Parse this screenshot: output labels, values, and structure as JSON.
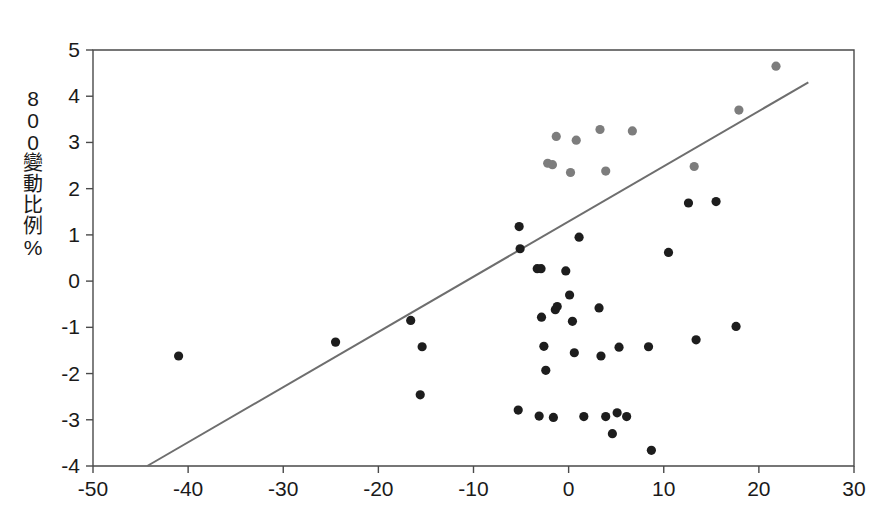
{
  "chart_data": {
    "type": "scatter",
    "title": "",
    "subtitle": "",
    "xlabel": "",
    "ylabel": "800變動比例%",
    "ylabel_chars": [
      "8",
      "0",
      "0",
      "變",
      "動",
      "比",
      "例",
      "%"
    ],
    "xlim": [
      -50,
      30
    ],
    "ylim": [
      -4,
      5
    ],
    "xticks": [
      -50,
      -40,
      -30,
      -20,
      -10,
      0,
      10,
      20,
      30
    ],
    "yticks": [
      -4,
      -3,
      -2,
      -1,
      0,
      1,
      2,
      3,
      4,
      5
    ],
    "xtick_labels": [
      "-50",
      "-40",
      "-30",
      "-20",
      "-10",
      "0",
      "10",
      "20",
      "30"
    ],
    "ytick_labels": [
      "-4",
      "-3",
      "-2",
      "-1",
      "0",
      "1",
      "2",
      "3",
      "4",
      "5"
    ],
    "grid": false,
    "legend": null,
    "legend_position": "none",
    "marker_colors": {
      "dark": "#1d1d1d",
      "light": "#7d7d7d"
    },
    "trendline": {
      "color": "#6e6e6e",
      "x_start": -44.3,
      "y_start": -4.0,
      "x_end": 25.2,
      "y_end": 4.3,
      "slope": 0.1193,
      "intercept": 1.286
    },
    "series": [
      {
        "name": "dark-points",
        "color": "#1d1d1d",
        "points": [
          [
            -41.0,
            -1.62
          ],
          [
            -24.5,
            -1.32
          ],
          [
            -16.6,
            -0.85
          ],
          [
            -15.4,
            -1.42
          ],
          [
            -15.6,
            -2.46
          ],
          [
            -5.2,
            1.18
          ],
          [
            -5.1,
            0.7
          ],
          [
            -5.3,
            -2.79
          ],
          [
            -3.3,
            0.27
          ],
          [
            -2.9,
            0.27
          ],
          [
            -2.85,
            -0.78
          ],
          [
            -2.6,
            -1.41
          ],
          [
            -2.4,
            -1.93
          ],
          [
            -3.1,
            -2.92
          ],
          [
            -1.4,
            -0.62
          ],
          [
            -1.2,
            -0.55
          ],
          [
            -1.6,
            -2.95
          ],
          [
            -0.3,
            0.22
          ],
          [
            0.1,
            -0.3
          ],
          [
            0.4,
            -0.87
          ],
          [
            0.6,
            -1.55
          ],
          [
            1.1,
            0.95
          ],
          [
            1.6,
            -2.93
          ],
          [
            3.2,
            -0.58
          ],
          [
            3.4,
            -1.62
          ],
          [
            3.9,
            -2.93
          ],
          [
            5.1,
            -2.85
          ],
          [
            4.6,
            -3.3
          ],
          [
            5.3,
            -1.43
          ],
          [
            6.1,
            -2.93
          ],
          [
            8.7,
            -3.66
          ],
          [
            8.4,
            -1.42
          ],
          [
            10.5,
            0.62
          ],
          [
            12.6,
            1.69
          ],
          [
            13.4,
            -1.27
          ],
          [
            15.5,
            1.72
          ],
          [
            17.6,
            -0.98
          ]
        ]
      },
      {
        "name": "light-points",
        "color": "#7d7d7d",
        "points": [
          [
            -2.2,
            2.55
          ],
          [
            -1.7,
            2.52
          ],
          [
            -1.3,
            3.13
          ],
          [
            0.2,
            2.35
          ],
          [
            0.8,
            3.05
          ],
          [
            3.3,
            3.28
          ],
          [
            3.9,
            2.38
          ],
          [
            6.7,
            3.25
          ],
          [
            13.2,
            2.48
          ],
          [
            17.9,
            3.7
          ],
          [
            21.8,
            4.65
          ]
        ]
      }
    ]
  }
}
